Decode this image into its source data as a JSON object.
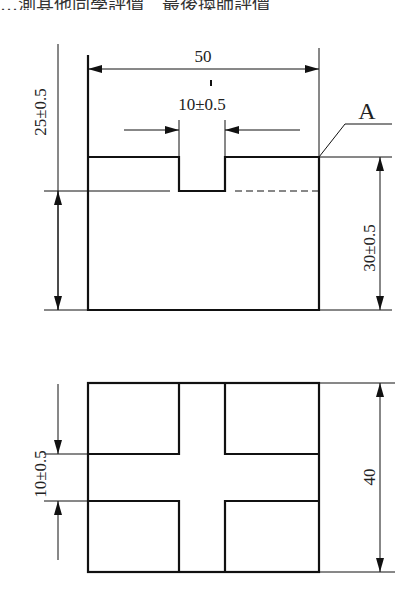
{
  "header": {
    "text": "…測其他同學評價　最後換師評價"
  },
  "top_view": {
    "width_label": "50",
    "slot_label": "10±0.5",
    "left_height_label": "25±0.5",
    "right_height_label": "30±0.5",
    "surface_label": "A"
  },
  "bottom_view": {
    "left_label": "10±0.5",
    "right_label": "40"
  }
}
